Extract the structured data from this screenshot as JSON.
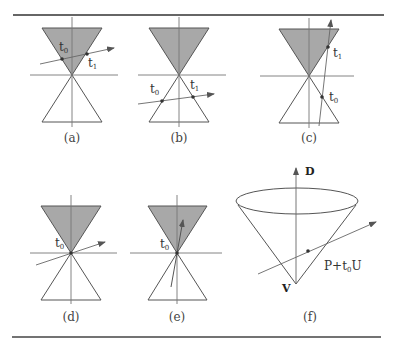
{
  "figure": {
    "colors": {
      "rule": "#333333",
      "stroke": "#555555",
      "fill_shaded": "#a8a8a8",
      "ray": "#666666",
      "point": "#333333"
    },
    "panels": [
      {
        "id": "a",
        "caption": "(a)",
        "labels": [
          {
            "text": "t",
            "sub": "0"
          },
          {
            "text": "t",
            "sub": "1"
          }
        ],
        "description": "ray crosses upper (shaded) cone twice"
      },
      {
        "id": "b",
        "caption": "(b)",
        "labels": [
          {
            "text": "t",
            "sub": "0"
          },
          {
            "text": "t",
            "sub": "1"
          }
        ],
        "description": "ray crosses lower (unshaded) cone twice"
      },
      {
        "id": "c",
        "caption": "(c)",
        "labels": [
          {
            "text": "t",
            "sub": "1"
          },
          {
            "text": "t",
            "sub": "0"
          }
        ],
        "description": "ray crosses lower cone then upper cone"
      },
      {
        "id": "d",
        "caption": "(d)",
        "labels": [
          {
            "text": "t",
            "sub": "0"
          }
        ],
        "description": "ray passes through vertex, outside cone"
      },
      {
        "id": "e",
        "caption": "(e)",
        "labels": [
          {
            "text": "t",
            "sub": "0"
          }
        ],
        "description": "ray passes through vertex, inside cone"
      },
      {
        "id": "f",
        "caption": "(f)",
        "labels": [
          {
            "text": "D"
          },
          {
            "text": "V"
          },
          {
            "text": "P+t",
            "sub": "0",
            "suffix": "U"
          }
        ],
        "description": "3D cone with axis D, vertex V, ray P+t0U"
      }
    ]
  }
}
